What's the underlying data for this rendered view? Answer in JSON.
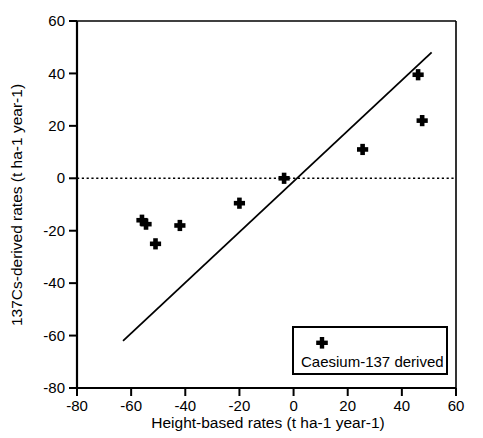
{
  "chart_data": {
    "type": "scatter",
    "title": "",
    "xlabel": "Height-based rates (t ha-1 year-1)",
    "ylabel": "137Cs-derived rates (t ha-1 year-1)",
    "xlim": [
      -80,
      60
    ],
    "ylim": [
      -80,
      60
    ],
    "xticks": [
      -80,
      -60,
      -40,
      -20,
      0,
      20,
      40,
      60
    ],
    "yticks": [
      -80,
      -60,
      -40,
      -20,
      0,
      20,
      40,
      60
    ],
    "xtick_labels": [
      "-80",
      "-60",
      "-40",
      "-20",
      "0",
      "20",
      "40",
      "60"
    ],
    "ytick_labels": [
      "-80",
      "-60",
      "-40",
      "-20",
      "0",
      "20",
      "40",
      "60"
    ],
    "grid": false,
    "legend_position": "lower-right",
    "series": [
      {
        "name": "Caesium-137 derived",
        "marker": "plus-cross",
        "color": "#000000",
        "points": [
          {
            "x": -56.0,
            "y": -16.0
          },
          {
            "x": -54.5,
            "y": -17.5
          },
          {
            "x": -51.0,
            "y": -25.0
          },
          {
            "x": -42.0,
            "y": -18.0
          },
          {
            "x": -20.0,
            "y": -9.5
          },
          {
            "x": -3.5,
            "y": 0.0
          },
          {
            "x": 25.5,
            "y": 11.0
          },
          {
            "x": 46.0,
            "y": 39.5
          },
          {
            "x": 47.5,
            "y": 22.0
          }
        ]
      }
    ],
    "reference_lines": [
      {
        "name": "one-to-one-line",
        "style": "solid",
        "color": "#000000",
        "x_start": -63.0,
        "y_start": -62.0,
        "x_end": 51.0,
        "y_end": 48.0
      },
      {
        "name": "zero-line",
        "style": "dotted",
        "color": "#000000",
        "y_value": 0
      }
    ]
  },
  "legend": {
    "entries": [
      {
        "label": "Caesium-137 derived",
        "marker": "plus-cross"
      }
    ]
  }
}
